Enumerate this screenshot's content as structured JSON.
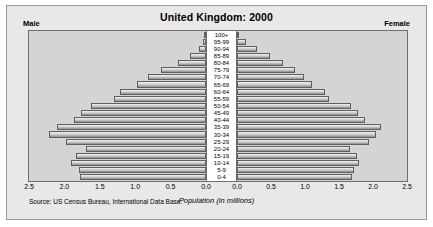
{
  "chart_data": {
    "type": "bar",
    "subtype": "population-pyramid",
    "title": "United Kingdom: 2000",
    "xlabel": "Population (in millions)",
    "ylabel": "",
    "grid": false,
    "legend_position": "top-corners",
    "left_side_label": "Male",
    "right_side_label": "Female",
    "axis_max": 2.5,
    "xlim_left": [
      2.5,
      0.0
    ],
    "xlim_right": [
      0.0,
      2.5
    ],
    "tick_labels_left": [
      "2.5",
      "2.0",
      "1.5",
      "1.0",
      "0.5",
      "0.0"
    ],
    "tick_labels_right": [
      "0.0",
      "0.5",
      "1.0",
      "1.5",
      "2.0",
      "2.5"
    ],
    "tick_values": [
      2.5,
      2.0,
      1.5,
      1.0,
      0.5,
      0.0
    ],
    "categories": [
      "100+",
      "95-99",
      "90-94",
      "85-89",
      "80-84",
      "75-79",
      "70-74",
      "65-69",
      "60-64",
      "55-59",
      "50-54",
      "45-49",
      "40-44",
      "35-39",
      "30-34",
      "25-29",
      "20-24",
      "15-19",
      "10-14",
      "5-9",
      "0-4"
    ],
    "series": [
      {
        "name": "Male",
        "side": "left",
        "values": [
          0.01,
          0.04,
          0.1,
          0.22,
          0.4,
          0.64,
          0.82,
          0.97,
          1.22,
          1.3,
          1.62,
          1.76,
          1.86,
          2.1,
          2.22,
          1.98,
          1.7,
          1.84,
          1.9,
          1.8,
          1.78
        ]
      },
      {
        "name": "Female",
        "side": "right",
        "values": [
          0.02,
          0.13,
          0.29,
          0.48,
          0.68,
          0.86,
          0.99,
          1.1,
          1.3,
          1.36,
          1.68,
          1.78,
          1.88,
          2.12,
          2.04,
          1.94,
          1.66,
          1.76,
          1.8,
          1.72,
          1.69
        ]
      }
    ],
    "source": "Source: US Census Bureau, International Data Base."
  },
  "colors": {
    "card_background": "#e8e8e8",
    "plot_background": "#d4d4d4",
    "center_band": "#ffffff",
    "bar_light": "#f1f1f1",
    "bar_dark": "#8e8e8e",
    "border": "#6e6e6e",
    "text": "#000000"
  }
}
